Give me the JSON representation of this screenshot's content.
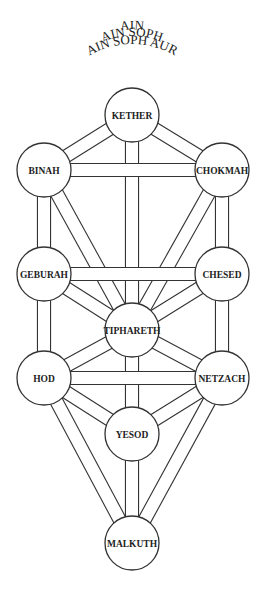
{
  "diagram": {
    "title_lines": [
      {
        "id": "ain",
        "text": "AIN"
      },
      {
        "id": "ain-soph",
        "text": "AIN SOPH"
      },
      {
        "id": "ain-soph-aur",
        "text": "AIN SOPH AUR"
      }
    ],
    "colors": {
      "stroke": "#333333",
      "fill": "#ffffff",
      "text": "#222222"
    },
    "sephiroth": [
      {
        "id": "kether",
        "label": "KETHER",
        "cx": 132,
        "cy": 115,
        "r": 27
      },
      {
        "id": "chokmah",
        "label": "CHOKMAH",
        "cx": 222,
        "cy": 170,
        "r": 27
      },
      {
        "id": "binah",
        "label": "BINAH",
        "cx": 44,
        "cy": 170,
        "r": 27
      },
      {
        "id": "chesed",
        "label": "CHESED",
        "cx": 222,
        "cy": 274,
        "r": 27
      },
      {
        "id": "geburah",
        "label": "GEBURAH",
        "cx": 44,
        "cy": 274,
        "r": 27
      },
      {
        "id": "tiphareth",
        "label": "TIPHARETH",
        "cx": 132,
        "cy": 330,
        "r": 27
      },
      {
        "id": "netzach",
        "label": "NETZACH",
        "cx": 222,
        "cy": 378,
        "r": 27
      },
      {
        "id": "hod",
        "label": "HOD",
        "cx": 44,
        "cy": 378,
        "r": 27
      },
      {
        "id": "yesod",
        "label": "YESOD",
        "cx": 132,
        "cy": 434,
        "r": 27
      },
      {
        "id": "malkuth",
        "label": "MALKUTH",
        "cx": 132,
        "cy": 543,
        "r": 27
      }
    ],
    "paths_under": [
      [
        "kether",
        "chokmah"
      ],
      [
        "kether",
        "binah"
      ],
      [
        "kether",
        "tiphareth"
      ],
      [
        "chokmah",
        "chesed"
      ],
      [
        "chokmah",
        "tiphareth"
      ],
      [
        "binah",
        "geburah"
      ],
      [
        "binah",
        "tiphareth"
      ],
      [
        "chesed",
        "tiphareth"
      ],
      [
        "chesed",
        "netzach"
      ],
      [
        "geburah",
        "tiphareth"
      ],
      [
        "geburah",
        "hod"
      ],
      [
        "tiphareth",
        "netzach"
      ],
      [
        "tiphareth",
        "hod"
      ],
      [
        "tiphareth",
        "yesod"
      ],
      [
        "netzach",
        "yesod"
      ],
      [
        "netzach",
        "malkuth"
      ],
      [
        "hod",
        "yesod"
      ],
      [
        "hod",
        "malkuth"
      ],
      [
        "yesod",
        "malkuth"
      ]
    ],
    "paths_over": [
      [
        "chokmah",
        "binah"
      ],
      [
        "chesed",
        "geburah"
      ],
      [
        "netzach",
        "hod"
      ]
    ],
    "channel_width": 12,
    "line_width": 1.1
  }
}
